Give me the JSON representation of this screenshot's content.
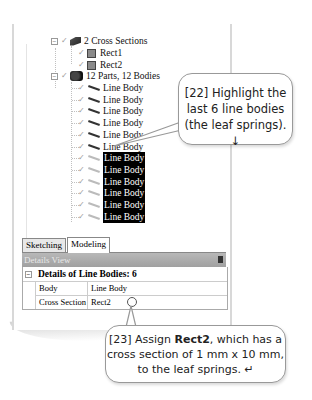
{
  "tree": {
    "cross_sections": {
      "label": "2 Cross Sections",
      "expander": "−",
      "children": [
        "Rect1",
        "Rect2"
      ]
    },
    "parts": {
      "label": "12 Parts, 12 Bodies",
      "expander": "−"
    },
    "line_bodies": [
      {
        "label": "Line Body",
        "selected": false
      },
      {
        "label": "Line Body",
        "selected": false
      },
      {
        "label": "Line Body",
        "selected": false
      },
      {
        "label": "Line Body",
        "selected": false
      },
      {
        "label": "Line Body",
        "selected": false
      },
      {
        "label": "Line Body",
        "selected": false
      },
      {
        "label": "Line Body",
        "selected": true
      },
      {
        "label": "Line Body",
        "selected": true
      },
      {
        "label": "Line Body",
        "selected": true
      },
      {
        "label": "Line Body",
        "selected": true
      },
      {
        "label": "Line Body",
        "selected": true
      },
      {
        "label": "Line Body",
        "selected": true
      }
    ]
  },
  "tabs": [
    {
      "label": "Sketching",
      "active": false
    },
    {
      "label": "Modeling",
      "active": true
    }
  ],
  "details_view": {
    "header": "Details View",
    "title": "Details of Line Bodies: 6",
    "expander": "−",
    "rows": [
      {
        "key": "Body",
        "value": "Line Body"
      },
      {
        "key": "Cross Section",
        "value": "Rect2"
      }
    ]
  },
  "callouts": {
    "step22": {
      "lines": [
        "[22] Highlight the",
        "last 6 line bodies",
        "(the leaf springs). ↓"
      ]
    },
    "step23": {
      "prefix": "[23] Assign ",
      "bold": "Rect2",
      "suffix": ", which has a",
      "line2": "cross section of 1 mm x 10 mm,",
      "line3": "to the leaf springs. ↵"
    }
  },
  "colors": {
    "selection_bg": "#000000",
    "selection_fg": "#ffffff",
    "header_bg": "#a8a8a8"
  }
}
